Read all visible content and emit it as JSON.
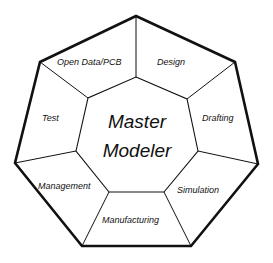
{
  "diagram": {
    "center": {
      "line1": "Master",
      "line2": "Modeler"
    },
    "segments": [
      {
        "id": "open-data-pcb",
        "label": "Open Data/PCB"
      },
      {
        "id": "design",
        "label": "Design"
      },
      {
        "id": "drafting",
        "label": "Drafting"
      },
      {
        "id": "simulation",
        "label": "Simulation"
      },
      {
        "id": "manufacturing",
        "label": "Manufacturing"
      },
      {
        "id": "management",
        "label": "Management"
      },
      {
        "id": "test",
        "label": "Test"
      }
    ],
    "colors": {
      "outline": "#111111",
      "background": "#ffffff",
      "text": "#111111"
    }
  }
}
